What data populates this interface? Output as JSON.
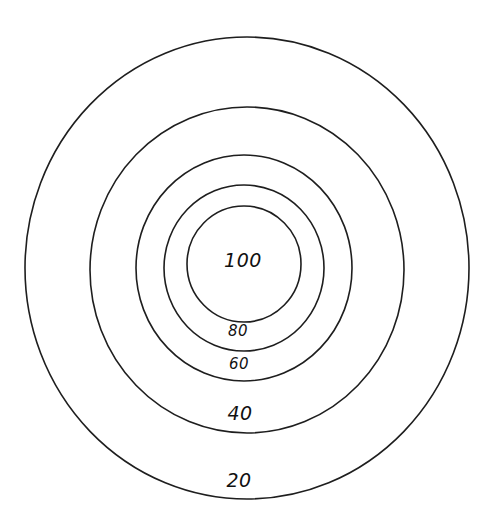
{
  "diagram": {
    "type": "concentric-target",
    "center": {
      "x": 247,
      "y": 267
    },
    "rings": [
      {
        "label": "20",
        "rx": 222,
        "ry": 231,
        "cx": 247,
        "cy": 268
      },
      {
        "label": "40",
        "rx": 157,
        "ry": 163,
        "cx": 247,
        "cy": 270
      },
      {
        "label": "60",
        "rx": 108,
        "ry": 113,
        "cx": 244,
        "cy": 268
      },
      {
        "label": "80",
        "rx": 80,
        "ry": 83,
        "cx": 244,
        "cy": 268
      },
      {
        "label": "100",
        "rx": 57,
        "ry": 58,
        "cx": 244,
        "cy": 264
      }
    ],
    "labels": {
      "bullseye": "100",
      "ring2": "80",
      "ring3": "60",
      "ring4": "40",
      "ring5": "20"
    },
    "stroke_color": "#1e1e1e",
    "background_color": "#ffffff"
  }
}
